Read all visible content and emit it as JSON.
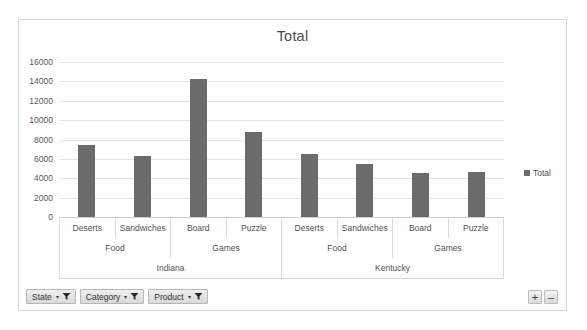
{
  "chart": {
    "title": "Total",
    "legend": {
      "label": "Total",
      "position": "right"
    },
    "bar_color": "#6b6b6b",
    "frame_border_color": "#d9d9d9",
    "gridline_color": "#e4e4e4"
  },
  "field_buttons": [
    {
      "label": "State",
      "caret": "▾",
      "icon": "funnel-icon"
    },
    {
      "label": "Category",
      "caret": "▾",
      "icon": "funnel-icon"
    },
    {
      "label": "Product",
      "caret": "▾",
      "icon": "funnel-icon"
    }
  ],
  "level_buttons": [
    {
      "label": "+",
      "name": "expand-field-button"
    },
    {
      "label": "–",
      "name": "collapse-field-button"
    }
  ],
  "chart_data": {
    "type": "bar",
    "title": "Total",
    "xlabel": "",
    "ylabel": "",
    "ylim": [
      0,
      16000
    ],
    "yticks": [
      0,
      2000,
      4000,
      6000,
      8000,
      10000,
      12000,
      14000,
      16000
    ],
    "ytick_labels": [
      "0",
      "2000",
      "4000",
      "6000",
      "8000",
      "10000",
      "12000",
      "14000",
      "16000"
    ],
    "grid": true,
    "legend": [
      "Total"
    ],
    "legend_position": "right",
    "axis_levels": [
      {
        "name": "Product",
        "items": [
          {
            "label": "Deserts",
            "span": 1
          },
          {
            "label": "Sandwiches",
            "span": 1
          },
          {
            "label": "Board",
            "span": 1
          },
          {
            "label": "Puzzle",
            "span": 1
          },
          {
            "label": "Deserts",
            "span": 1
          },
          {
            "label": "Sandwiches",
            "span": 1
          },
          {
            "label": "Board",
            "span": 1
          },
          {
            "label": "Puzzle",
            "span": 1
          }
        ]
      },
      {
        "name": "Category",
        "items": [
          {
            "label": "Food",
            "span": 2
          },
          {
            "label": "Games",
            "span": 2
          },
          {
            "label": "Food",
            "span": 2
          },
          {
            "label": "Games",
            "span": 2
          }
        ]
      },
      {
        "name": "State",
        "items": [
          {
            "label": "Indiana",
            "span": 4
          },
          {
            "label": "Kentucky",
            "span": 4
          }
        ]
      }
    ],
    "categories": [
      "Indiana / Food / Deserts",
      "Indiana / Food / Sandwiches",
      "Indiana / Games / Board",
      "Indiana / Games / Puzzle",
      "Kentucky / Food / Deserts",
      "Kentucky / Food / Sandwiches",
      "Kentucky / Games / Board",
      "Kentucky / Games / Puzzle"
    ],
    "series": [
      {
        "name": "Total",
        "color": "#6b6b6b",
        "values": [
          7430,
          6300,
          14250,
          8770,
          6500,
          5470,
          4540,
          4640
        ]
      }
    ]
  }
}
